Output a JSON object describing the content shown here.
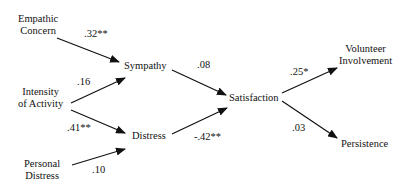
{
  "diagram": {
    "type": "path-model",
    "nodes": {
      "empathic_concern": {
        "line1": "Empathic",
        "line2": "Concern"
      },
      "intensity": {
        "line1": "Intensity",
        "line2": "of Activity"
      },
      "personal_distress": {
        "line1": "Personal",
        "line2": "Distress"
      },
      "sympathy": {
        "label": "Sympathy"
      },
      "distress": {
        "label": "Distress"
      },
      "satisfaction": {
        "label": "Satisfaction"
      },
      "volunteer_involvement": {
        "line1": "Volunteer",
        "line2": "Involvement"
      },
      "persistence": {
        "label": "Persistence"
      }
    },
    "edges": [
      {
        "from": "Empathic Concern",
        "to": "Sympathy",
        "coef": ".32**"
      },
      {
        "from": "Intensity of Activity",
        "to": "Sympathy",
        "coef": ".16"
      },
      {
        "from": "Intensity of Activity",
        "to": "Distress",
        "coef": ".41**"
      },
      {
        "from": "Personal Distress",
        "to": "Distress",
        "coef": ".10"
      },
      {
        "from": "Sympathy",
        "to": "Satisfaction",
        "coef": ".08"
      },
      {
        "from": "Distress",
        "to": "Satisfaction",
        "coef": "-.42**"
      },
      {
        "from": "Satisfaction",
        "to": "Volunteer Involvement",
        "coef": ".25*"
      },
      {
        "from": "Satisfaction",
        "to": "Persistence",
        "coef": ".03"
      }
    ]
  }
}
